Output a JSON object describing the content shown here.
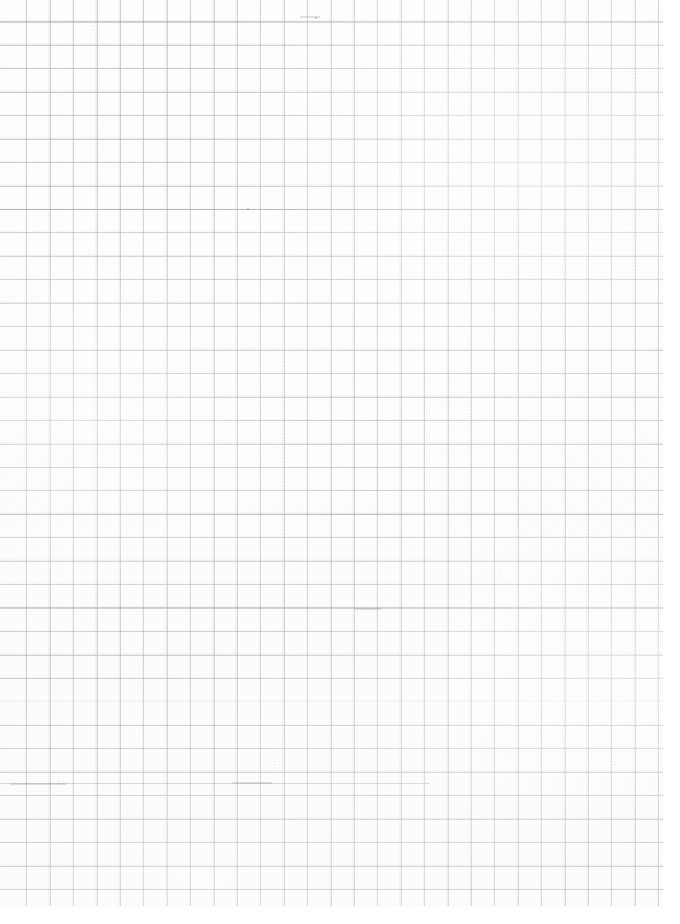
{
  "document": {
    "kind": "scanned-graph-paper",
    "title": "Blank graph paper scan",
    "alt_text": "A scanned blank sheet of quadrille (graph) paper with a faint light-grey square grid and no writing.",
    "width_px": 680,
    "height_px": 924,
    "background_color": "#ffffff",
    "has_text": false,
    "has_handwriting": false,
    "page_count": 1
  },
  "grid": {
    "label": "square grid",
    "cell_size_px": 23.4,
    "columns": 29,
    "rows": 39,
    "line_color": "#969ba8",
    "line_width_px": 1,
    "origin_offset_x_px": 4,
    "origin_offset_y_px": -1,
    "grid_area_width_px": 663,
    "grid_area_height_px": 906
  },
  "margins": {
    "right_white_px": 17,
    "bottom_white_px": 18
  },
  "emphasis_rules": [
    {
      "name": "rule-upper",
      "x": 0,
      "y": 22,
      "width": 663
    },
    {
      "name": "rule-mid-upper",
      "x": 0,
      "y": 209,
      "width": 663
    },
    {
      "name": "rule-mid",
      "x": 0,
      "y": 514,
      "width": 663
    },
    {
      "name": "rule-lower",
      "x": 0,
      "y": 607,
      "width": 663
    },
    {
      "name": "rule-bottom",
      "x": 0,
      "y": 783,
      "width": 430
    }
  ],
  "artifacts": {
    "specks": [
      {
        "name": "speck-top-left",
        "x": 92,
        "y": 26,
        "size": 1.4
      },
      {
        "name": "speck-top-center",
        "x": 315,
        "y": 17,
        "size": 1.8
      },
      {
        "name": "speck-top-center-2",
        "x": 318,
        "y": 22,
        "size": 1.2
      },
      {
        "name": "speck-upper-mid",
        "x": 247,
        "y": 208,
        "size": 1.5
      },
      {
        "name": "speck-mid-right",
        "x": 500,
        "y": 573,
        "size": 1.2
      },
      {
        "name": "speck-lower-left",
        "x": 58,
        "y": 781,
        "size": 1.4
      },
      {
        "name": "speck-lower-mid",
        "x": 274,
        "y": 761,
        "size": 1.3
      },
      {
        "name": "speck-bottom-right",
        "x": 614,
        "y": 764,
        "size": 1.2
      }
    ],
    "smudges": [
      {
        "name": "smudge-lower-left",
        "x": 10,
        "y": 783,
        "width": 56,
        "height": 2
      },
      {
        "name": "smudge-lower-mid",
        "x": 232,
        "y": 782,
        "width": 40,
        "height": 2
      },
      {
        "name": "smudge-top-center",
        "x": 300,
        "y": 16,
        "width": 20,
        "height": 2
      },
      {
        "name": "smudge-mid-center",
        "x": 355,
        "y": 608,
        "width": 26,
        "height": 2
      }
    ]
  }
}
